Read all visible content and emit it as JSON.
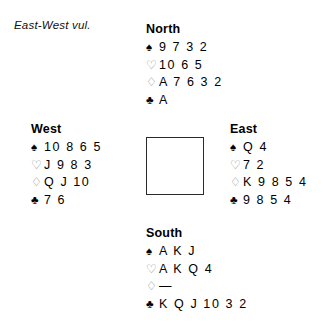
{
  "vulnerability": {
    "label": "East-West vul."
  },
  "suits": {
    "spade": {
      "name": "spade-icon",
      "glyph": "♠",
      "fill": "black",
      "color": "#000000"
    },
    "heart": {
      "name": "heart-icon",
      "glyph": "♡",
      "fill": "hollow",
      "color": "#8c8c8c"
    },
    "diamond": {
      "name": "diamond-icon",
      "glyph": "♢",
      "fill": "hollow",
      "color": "#8c8c8c"
    },
    "club": {
      "name": "club-icon",
      "glyph": "♣",
      "fill": "black",
      "color": "#000000"
    }
  },
  "hands": {
    "north": {
      "label": "North",
      "spades": "9 7 3 2",
      "hearts": "10 6 5",
      "diamonds": "A 7 6 3 2",
      "clubs": "A"
    },
    "west": {
      "label": "West",
      "spades": "10 8 6 5",
      "hearts": "J 9 8 3",
      "diamonds": "Q J 10",
      "clubs": "7 6"
    },
    "east": {
      "label": "East",
      "spades": "Q 4",
      "hearts": "7 2",
      "diamonds": "K 9 8 5 4",
      "clubs": "9 8 5 4"
    },
    "south": {
      "label": "South",
      "spades": "A K J",
      "hearts": "A K Q 4",
      "diamonds": "—",
      "clubs": "K Q J 10 3 2"
    }
  },
  "center_box": {
    "content": "",
    "border_color": "#2a2a2a"
  }
}
